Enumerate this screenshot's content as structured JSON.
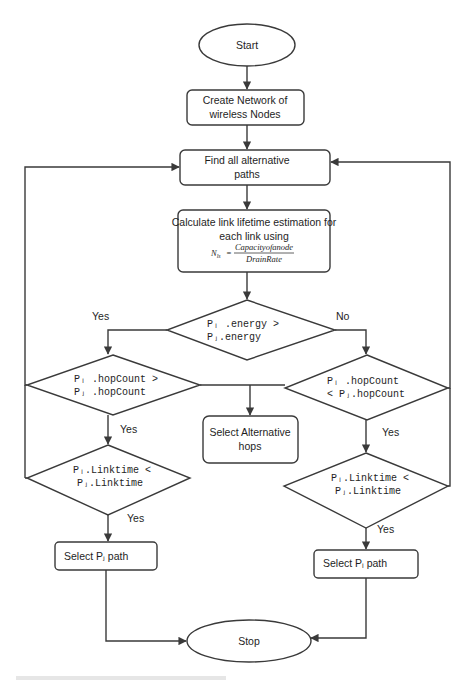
{
  "flowchart": {
    "colors": {
      "stroke": "#3a3a3a",
      "text": "#1e1e1e",
      "background": "#ffffff"
    },
    "nodes": {
      "start": {
        "type": "terminator",
        "label": "Start"
      },
      "create_network": {
        "type": "process",
        "lines": [
          "Create Network of",
          "wireless Nodes"
        ]
      },
      "find_paths": {
        "type": "process",
        "lines": [
          "Find all alternative",
          "paths"
        ]
      },
      "calc_lifetime": {
        "type": "process",
        "lines": [
          "Calculate link lifetime estimation for",
          "each link using"
        ],
        "formula": {
          "lhs": "N",
          "lhs_sub": "ls",
          "equals": "=",
          "numerator": "Capacityofanode",
          "denominator": "DrainRate"
        }
      },
      "energy_decision": {
        "type": "decision",
        "lines": [
          "Pᵢ .energy >",
          "Pⱼ.energy"
        ]
      },
      "hop_left_decision": {
        "type": "decision",
        "lines": [
          "Pᵢ .hopCount >",
          "Pⱼ .hopCount"
        ]
      },
      "hop_right_decision": {
        "type": "decision",
        "lines": [
          "Pᵢ .hopCount",
          "< Pⱼ.hopCount"
        ]
      },
      "select_alt_hops": {
        "type": "process",
        "lines": [
          "Select Alternative",
          "hops"
        ]
      },
      "link_left_decision": {
        "type": "decision",
        "lines": [
          "Pᵢ.Linktime <",
          "Pⱼ.Linktime"
        ]
      },
      "link_right_decision": {
        "type": "decision",
        "lines": [
          "Pᵢ.Linktime <",
          "Pⱼ.Linktime"
        ]
      },
      "select_pj": {
        "type": "process",
        "label": "Select Pⱼ path"
      },
      "select_pi": {
        "type": "process",
        "label": "Select Pᵢ path"
      },
      "stop": {
        "type": "terminator",
        "label": "Stop"
      }
    },
    "edge_labels": {
      "energy_yes": "Yes",
      "energy_no": "No",
      "hop_left_yes": "Yes",
      "hop_right_yes": "Yes",
      "link_left_yes": "Yes",
      "link_right_yes": "Yes"
    }
  }
}
